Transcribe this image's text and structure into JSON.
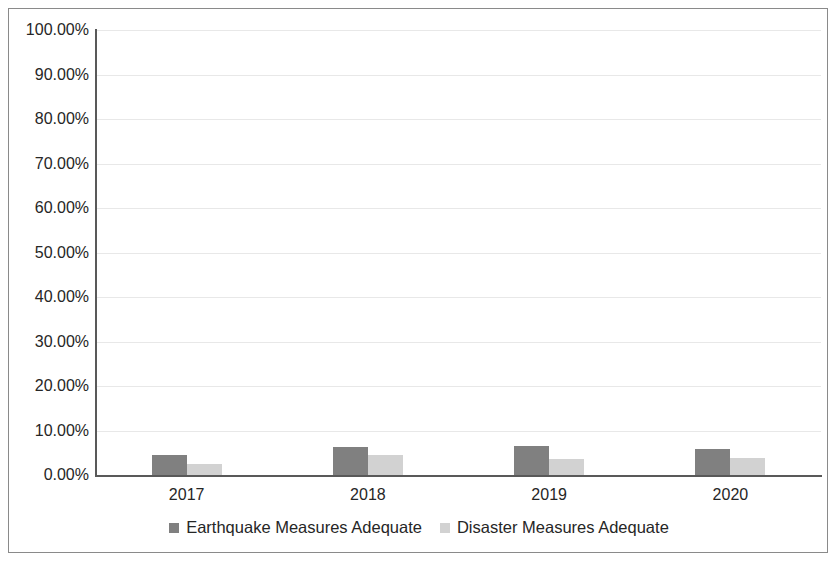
{
  "chart_data": {
    "type": "bar",
    "title": "",
    "xlabel": "",
    "ylabel": "",
    "categories": [
      "2017",
      "2018",
      "2019",
      "2020"
    ],
    "ylim": [
      0,
      100
    ],
    "y_tick_labels": [
      "100.00%",
      "90.00%",
      "80.00%",
      "70.00%",
      "60.00%",
      "50.00%",
      "40.00%",
      "30.00%",
      "20.00%",
      "10.00%",
      "0.00%"
    ],
    "y_tick_values": [
      100,
      90,
      80,
      70,
      60,
      50,
      40,
      30,
      20,
      10,
      0
    ],
    "grid": true,
    "legend_position": "bottom",
    "series": [
      {
        "name": "Earthquake Measures Adequate",
        "color": "#808080",
        "values": [
          4.5,
          6.3,
          6.5,
          5.8
        ]
      },
      {
        "name": "Disaster Measures Adequate",
        "color": "#d2d2d2",
        "values": [
          2.5,
          4.5,
          3.7,
          3.8
        ]
      }
    ]
  }
}
